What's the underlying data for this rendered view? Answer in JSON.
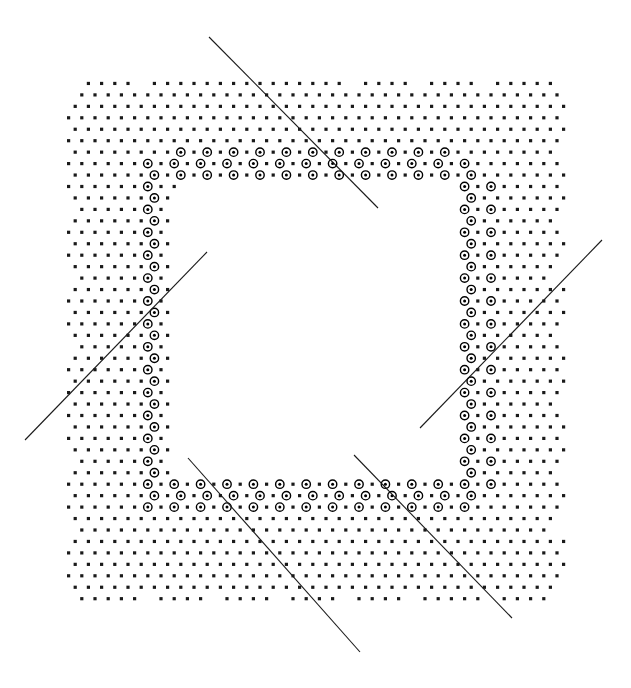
{
  "figure": {
    "width": 631,
    "height": 688,
    "background_color": "#ffffff",
    "ink_color": "#000000"
  },
  "chart_data": {
    "type": "scatter",
    "subtitle": "",
    "xlabel": "",
    "ylabel": "",
    "xlim": [
      0,
      631
    ],
    "ylim": [
      688,
      0
    ],
    "grid": false,
    "legend": false,
    "legend_position": "none",
    "annotations": [],
    "tick_labels_x": [],
    "tick_labels_y": [],
    "lattice": {
      "description": "Triangular (hexagonal) point lattice clipped to a square annulus whose outer boundary is a scalloped union of circular arcs.",
      "spacing_x": 13.2,
      "spacing_y": 11.45,
      "row_offset_x": 6.6,
      "dot_radius": 1.6,
      "dot_color": "#1a1a1a"
    },
    "annulus": {
      "outer_left": 62,
      "outer_top": 72,
      "outer_right": 568,
      "outer_bottom": 608,
      "inner_left": 168,
      "inner_top": 186,
      "inner_right": 462,
      "inner_bottom": 480,
      "corner_radius": 46,
      "scallop_radius": 47,
      "scallop_period": 66
    },
    "ring_markers": {
      "description": "Larger open-circle markers with a filled centre, distributed in bands just inside the inner edge of the annulus.",
      "outer_radius": 4.2,
      "inner_dot_radius": 1.5,
      "stroke_width": 1.4,
      "band_thickness": 34,
      "count_estimate": 132
    },
    "series": [
      {
        "name": "lattice-dots",
        "marker": "filled-square-dot",
        "size": 3.2,
        "color": "#1a1a1a"
      },
      {
        "name": "ring-markers",
        "marker": "open-circle-with-centre",
        "size": 8.4,
        "color": "#000000"
      },
      {
        "name": "diagonal-lines",
        "marker": "line-segment",
        "size": 1.1,
        "color": "#1a1a1a"
      }
    ],
    "lines": [
      {
        "id": "line-top-left-descending",
        "x1": 209,
        "y1": 37,
        "x2": 378,
        "y2": 208,
        "slope_direction": "down-right",
        "length": 239
      },
      {
        "id": "line-left-ascending",
        "x1": 25,
        "y1": 440,
        "x2": 207,
        "y2": 252,
        "slope_direction": "up-right",
        "length": 261
      },
      {
        "id": "line-right-ascending",
        "x1": 420,
        "y1": 428,
        "x2": 602,
        "y2": 240,
        "slope_direction": "up-right",
        "length": 261
      },
      {
        "id": "line-bottom-left-descending",
        "x1": 188,
        "y1": 458,
        "x2": 360,
        "y2": 652,
        "slope_direction": "down-right",
        "length": 259
      },
      {
        "id": "line-bottom-right-descending",
        "x1": 354,
        "y1": 455,
        "x2": 512,
        "y2": 618,
        "slope_direction": "down-right",
        "length": 227
      }
    ]
  }
}
